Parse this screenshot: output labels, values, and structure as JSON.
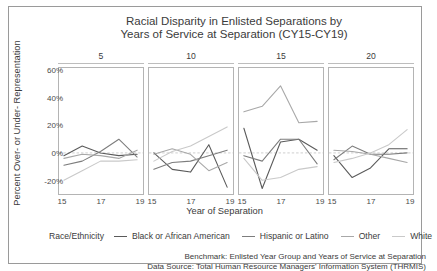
{
  "chart_data": {
    "type": "line",
    "title": "Racial Disparity in Enlisted Separations by Years of Service at Separation (CY15-CY19)",
    "title_line1": "Racial Disparity in Enlisted Separations by",
    "title_line2": "Years of Service at Separation (CY15-CY19)",
    "xlabel": "Year of Separation",
    "ylabel": "Percent Over- or Under- Representation",
    "legend_title": "Race/Ethnicity",
    "legend_position": "bottom",
    "grid": false,
    "zero_reference_line": true,
    "ylim": [
      -30,
      62
    ],
    "yticks": [
      "-20%",
      "0%",
      "20%",
      "40%",
      "60%"
    ],
    "ytick_values": [
      -20,
      0,
      20,
      40,
      60
    ],
    "x": [
      15,
      16,
      17,
      18,
      19
    ],
    "xticks": [
      "15",
      "17",
      "19"
    ],
    "xtick_values": [
      15,
      17,
      19
    ],
    "facet_variable": "Years of Service at Separation",
    "facets": [
      {
        "label": "5",
        "series": [
          {
            "name": "Black or African American",
            "color": "#5a5a5a",
            "values": [
              -2,
              5,
              0,
              -2,
              -1
            ]
          },
          {
            "name": "Hispanic or Latino",
            "color": "#7d7d7d",
            "values": [
              -9,
              -6,
              1,
              10,
              -3
            ]
          },
          {
            "name": "Other",
            "color": "#a8a8a8",
            "values": [
              -4,
              -1,
              -2,
              -4,
              2
            ]
          },
          {
            "name": "White",
            "color": "#c9c9c9",
            "values": [
              -20,
              -13,
              -6,
              -6,
              -5
            ]
          }
        ]
      },
      {
        "label": "10",
        "series": [
          {
            "name": "Black or African American",
            "color": "#5a5a5a",
            "values": [
              0,
              -12,
              -14,
              6,
              -25
            ]
          },
          {
            "name": "Hispanic or Latino",
            "color": "#7d7d7d",
            "values": [
              -12,
              -7,
              -6,
              -2,
              2
            ]
          },
          {
            "name": "Other",
            "color": "#a8a8a8",
            "values": [
              -1,
              3,
              -1,
              -13,
              -7
            ]
          },
          {
            "name": "White",
            "color": "#c9c9c9",
            "values": [
              -6,
              1,
              5,
              12,
              19
            ]
          }
        ]
      },
      {
        "label": "15",
        "series": [
          {
            "name": "Black or African American",
            "color": "#5a5a5a",
            "values": [
              18,
              -26,
              8,
              10,
              2
            ]
          },
          {
            "name": "Hispanic or Latino",
            "color": "#7d7d7d",
            "values": [
              -2,
              -6,
              10,
              10,
              -8
            ]
          },
          {
            "name": "Other",
            "color": "#a8a8a8",
            "values": [
              30,
              34,
              49,
              22,
              23
            ]
          },
          {
            "name": "White",
            "color": "#c9c9c9",
            "values": [
              -4,
              -20,
              -18,
              -12,
              -10
            ]
          }
        ]
      },
      {
        "label": "20",
        "series": [
          {
            "name": "Black or African American",
            "color": "#5a5a5a",
            "values": [
              -2,
              -18,
              -11,
              3,
              3
            ]
          },
          {
            "name": "Hispanic or Latino",
            "color": "#7d7d7d",
            "values": [
              -5,
              5,
              -1,
              -1,
              0
            ]
          },
          {
            "name": "Other",
            "color": "#a8a8a8",
            "values": [
              2,
              1,
              -1,
              -4,
              -7
            ]
          },
          {
            "name": "White",
            "color": "#c9c9c9",
            "values": [
              -7,
              -4,
              0,
              6,
              17
            ]
          }
        ]
      }
    ]
  },
  "footer": {
    "line1": "Benchmark: Enlisted Year Group and Years of Service at Separation",
    "line2": "Data Source: Total Human Resource Managers' Information System (THRMIS)"
  }
}
